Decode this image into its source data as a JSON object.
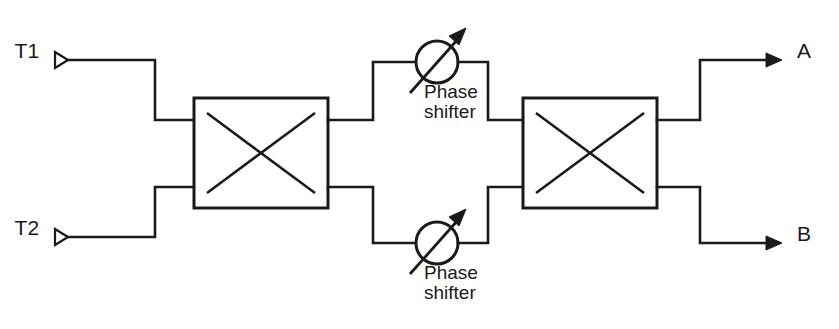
{
  "diagram": {
    "stroke_color": "#1a1a1a",
    "background_color": "#ffffff",
    "inputs": [
      {
        "id": "t1",
        "label": "T1"
      },
      {
        "id": "t2",
        "label": "T2"
      }
    ],
    "outputs": [
      {
        "id": "a",
        "label": "A"
      },
      {
        "id": "b",
        "label": "B"
      }
    ],
    "couplers": [
      {
        "id": "coupler-left",
        "symbol": "cross"
      },
      {
        "id": "coupler-right",
        "symbol": "cross"
      }
    ],
    "phase_shifters": [
      {
        "id": "phase-shifter-top",
        "label_line1": "Phase",
        "label_line2": "shifter",
        "symbol": "circle-with-diagonal-arrow"
      },
      {
        "id": "phase-shifter-bottom",
        "label_line1": "Phase",
        "label_line2": "shifter",
        "symbol": "circle-with-diagonal-arrow"
      }
    ]
  }
}
